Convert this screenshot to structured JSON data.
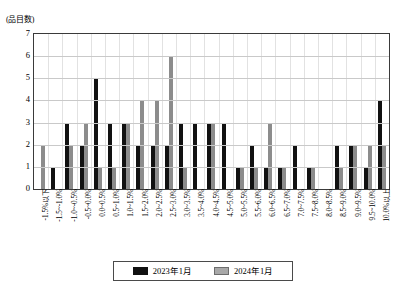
{
  "chart_data": {
    "type": "bar",
    "title": "",
    "subtitle": "",
    "xlabel": "",
    "ylabel": "(品目数)",
    "ylim": [
      0,
      7
    ],
    "yticks": [
      0,
      1,
      2,
      3,
      4,
      5,
      6,
      7
    ],
    "grid": true,
    "legend_position": "bottom",
    "categories": [
      "-1.5%以下",
      "-1.5~-1.0%",
      "-1.0~-0.5%",
      "-0.5~0.0%",
      "0.0~0.5%",
      "0.5~1.0%",
      "1.0~1.5%",
      "1.5~2.0%",
      "2.0~2.5%",
      "2.5~3.0%",
      "3.0~3.5%",
      "3.5~4.0%",
      "4.0~4.5%",
      "4.5~5.0%",
      "5.0~5.5%",
      "5.5~6.0%",
      "6.0~6.5%",
      "6.5~7.0%",
      "7.0~7.5%",
      "7.5~8.0%",
      "8.0~8.5%",
      "8.5~9.0%",
      "9.0~9.5%",
      "9.5~10.0%",
      "10.0%以上"
    ],
    "series": [
      {
        "name": "2023年1月",
        "color": "#111111",
        "values": [
          0,
          1,
          3,
          2,
          5,
          3,
          3,
          2,
          2,
          2,
          3,
          3,
          3,
          3,
          1,
          2,
          1,
          1,
          2,
          1,
          0,
          2,
          2,
          1,
          4
        ]
      },
      {
        "name": "2024年1月",
        "color": "#8c8c8c",
        "values": [
          2,
          0,
          2,
          3,
          1,
          1,
          3,
          4,
          4,
          6,
          1,
          0,
          3,
          0,
          1,
          1,
          3,
          1,
          0,
          1,
          0,
          1,
          2,
          2,
          2
        ]
      }
    ]
  },
  "legend": {
    "items": [
      {
        "label": "2023年1月"
      },
      {
        "label": "2024年1月"
      }
    ]
  }
}
